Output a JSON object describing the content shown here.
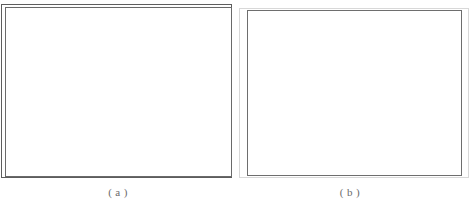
{
  "figure": {
    "panels": [
      {
        "id": "a",
        "caption": "( a )",
        "content": "",
        "border_style": "double-rule",
        "outer_border_color": "#5d5d5d",
        "inner_border_color": "#6a6a6a",
        "fill_color": "#ffffff"
      },
      {
        "id": "b",
        "caption": "( b )",
        "content": "",
        "border_style": "offset-double-rule",
        "outer_border_color": "#d8d8d8",
        "inner_border_color": "#6e6e6e",
        "fill_color": "#ffffff"
      }
    ],
    "background_color": "#ffffff",
    "caption_color": "#6b6b6b"
  }
}
